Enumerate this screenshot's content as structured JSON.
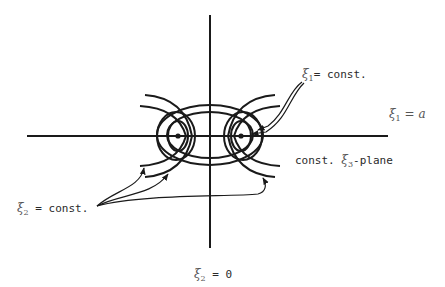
{
  "diagram": {
    "axes": {
      "horizontal_label": {
        "symbol": "ξ",
        "sub": "1",
        "rest": " = a"
      },
      "vertical_label": {
        "symbol": "ξ",
        "sub": "2",
        "rest": " = 0"
      }
    },
    "labels": {
      "xi1_const": {
        "symbol": "ξ",
        "sub": "1",
        "rest": "= const."
      },
      "xi3_plane": {
        "prefix": "const. ",
        "symbol": "ξ",
        "sub": "3",
        "rest": "-plane"
      },
      "xi2_const": {
        "symbol": "ξ",
        "sub": "2",
        "rest": " = const."
      }
    },
    "foci": [
      {
        "x": 178,
        "y": 136
      },
      {
        "x": 241,
        "y": 136
      }
    ],
    "colors": {
      "ink": "#1a1a1a",
      "text": "#2a2a2a",
      "background": "#ffffff"
    }
  }
}
